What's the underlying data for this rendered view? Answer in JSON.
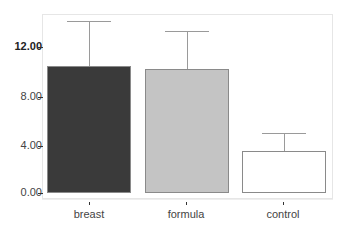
{
  "chart_data": {
    "type": "bar",
    "title": "",
    "xlabel": "",
    "ylabel": "",
    "categories": [
      "breast",
      "formula",
      "control"
    ],
    "values": [
      10.3,
      10.1,
      3.4
    ],
    "error_upper": [
      14.0,
      13.2,
      4.9
    ],
    "bar_colors": [
      "#3a3a3a",
      "#c4c4c4",
      "#ffffff"
    ],
    "bar_border": "#8a8a8a",
    "ylim": [
      0,
      15
    ],
    "yticks": [
      0,
      4,
      8,
      12
    ],
    "ytick_labels": [
      "0.00",
      "4.00",
      "8.00",
      "12.00"
    ],
    "grid": false,
    "legend": null
  },
  "axis": {
    "y_labels": [
      "12.00",
      "8.00",
      "4.00",
      "0.00"
    ],
    "x_labels": [
      "breast",
      "formula",
      "control"
    ]
  }
}
